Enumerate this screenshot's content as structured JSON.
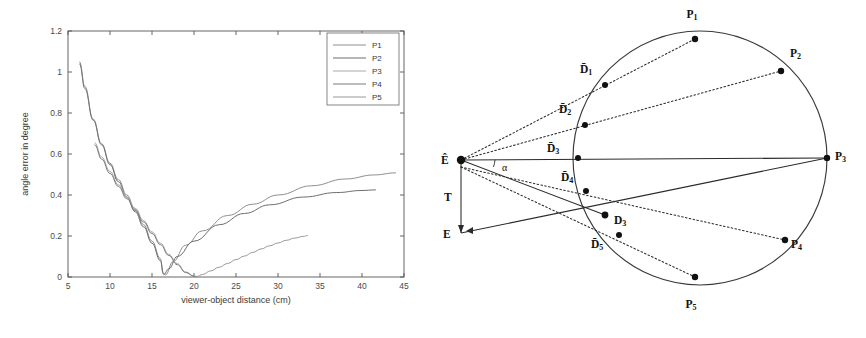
{
  "figure": {
    "panels": [
      "angle-error-plot",
      "viewing-geometry-diagram"
    ]
  },
  "chart_data": {
    "type": "line",
    "title": "",
    "xlabel": "viewer-object distance (cm)",
    "ylabel": "angle error in degree",
    "xlim": [
      5,
      45
    ],
    "ylim": [
      0,
      1.2
    ],
    "xticks": [
      "5",
      "10",
      "15",
      "20",
      "25",
      "30",
      "35",
      "40",
      "45"
    ],
    "yticks": [
      "0",
      "0.2",
      "0.4",
      "0.6",
      "0.8",
      "1",
      "1.2"
    ],
    "grid": false,
    "legend_position": "top-right",
    "series": [
      {
        "name": "P1",
        "color": "#8f8f8f",
        "points": [
          [
            6.4,
            1.05
          ],
          [
            7.0,
            0.93
          ],
          [
            8.0,
            0.77
          ],
          [
            9.0,
            0.65
          ],
          [
            10.0,
            0.555
          ],
          [
            11.0,
            0.475
          ],
          [
            12.0,
            0.4
          ],
          [
            13.0,
            0.33
          ],
          [
            14.0,
            0.255
          ],
          [
            15.0,
            0.175
          ],
          [
            16.0,
            0.09
          ],
          [
            16.3,
            0.02
          ],
          [
            16.6,
            0.01
          ],
          [
            17.5,
            0.075
          ],
          [
            19.0,
            0.155
          ],
          [
            21.0,
            0.225
          ],
          [
            24.0,
            0.3
          ],
          [
            27.0,
            0.355
          ],
          [
            30.0,
            0.4
          ],
          [
            34.0,
            0.445
          ],
          [
            38.0,
            0.478
          ],
          [
            41.5,
            0.498
          ],
          [
            44.0,
            0.508
          ]
        ]
      },
      {
        "name": "P2",
        "color": "#6e6e6e",
        "points": [
          [
            6.4,
            1.04
          ],
          [
            7.0,
            0.92
          ],
          [
            8.0,
            0.765
          ],
          [
            9.0,
            0.645
          ],
          [
            10.0,
            0.548
          ],
          [
            11.0,
            0.465
          ],
          [
            12.0,
            0.39
          ],
          [
            13.0,
            0.318
          ],
          [
            14.0,
            0.245
          ],
          [
            15.0,
            0.165
          ],
          [
            16.0,
            0.08
          ],
          [
            16.4,
            0.012
          ],
          [
            17.0,
            0.04
          ],
          [
            18.0,
            0.1
          ],
          [
            20.0,
            0.175
          ],
          [
            23.0,
            0.255
          ],
          [
            26.0,
            0.31
          ],
          [
            29.0,
            0.352
          ],
          [
            33.0,
            0.39
          ],
          [
            37.0,
            0.412
          ],
          [
            40.0,
            0.422
          ],
          [
            41.6,
            0.425
          ]
        ]
      },
      {
        "name": "P3",
        "color": "#a8a8a8",
        "points": [
          [
            8.2,
            0.655
          ],
          [
            9.0,
            0.585
          ],
          [
            10.0,
            0.515
          ],
          [
            11.0,
            0.45
          ],
          [
            12.0,
            0.39
          ],
          [
            13.0,
            0.335
          ],
          [
            14.0,
            0.275
          ],
          [
            15.0,
            0.22
          ],
          [
            16.0,
            0.165
          ],
          [
            17.0,
            0.11
          ],
          [
            18.0,
            0.065
          ],
          [
            19.0,
            0.025
          ],
          [
            20.0,
            0.005
          ],
          [
            20.4,
            0.002
          ]
        ]
      },
      {
        "name": "P4",
        "color": "#7a7a7a",
        "points": [
          [
            8.2,
            0.645
          ],
          [
            9.0,
            0.575
          ],
          [
            10.0,
            0.505
          ],
          [
            11.0,
            0.442
          ],
          [
            12.0,
            0.382
          ],
          [
            13.0,
            0.325
          ],
          [
            14.0,
            0.268
          ],
          [
            15.0,
            0.212
          ],
          [
            16.0,
            0.158
          ],
          [
            17.0,
            0.105
          ],
          [
            18.0,
            0.06
          ],
          [
            19.0,
            0.022
          ],
          [
            20.0,
            0.004
          ],
          [
            20.3,
            0.001
          ]
        ]
      },
      {
        "name": "P5",
        "color": "#999999",
        "points": [
          [
            20.4,
            0.003
          ],
          [
            21.0,
            0.012
          ],
          [
            22.0,
            0.03
          ],
          [
            23.0,
            0.048
          ],
          [
            24.0,
            0.066
          ],
          [
            25.0,
            0.085
          ],
          [
            26.0,
            0.102
          ],
          [
            27.0,
            0.12
          ],
          [
            28.0,
            0.137
          ],
          [
            29.0,
            0.152
          ],
          [
            30.0,
            0.166
          ],
          [
            31.0,
            0.179
          ],
          [
            32.0,
            0.19
          ],
          [
            33.0,
            0.198
          ],
          [
            33.5,
            0.202
          ]
        ]
      }
    ]
  },
  "legend": {
    "entries": [
      {
        "label": "P1"
      },
      {
        "label": "P2"
      },
      {
        "label": "P3"
      },
      {
        "label": "P4"
      },
      {
        "label": "P5"
      }
    ]
  },
  "diagram": {
    "name": "viewing-geometry-diagram",
    "labels": {
      "eye_estimated": "Ê",
      "eye_true": "E",
      "translation": "T",
      "angle": "α"
    },
    "circle_points": [
      {
        "id": "P1",
        "letter": "P",
        "sub": "1"
      },
      {
        "id": "P2",
        "letter": "P",
        "sub": "2"
      },
      {
        "id": "P3",
        "letter": "P",
        "sub": "3"
      },
      {
        "id": "P4",
        "letter": "P",
        "sub": "4"
      },
      {
        "id": "P5",
        "letter": "P",
        "sub": "5"
      }
    ],
    "direction_points": [
      {
        "id": "D1",
        "letter": "D̄",
        "sub": "1"
      },
      {
        "id": "D2",
        "letter": "D̄",
        "sub": "2"
      },
      {
        "id": "D3bar",
        "letter": "D̄",
        "sub": "3"
      },
      {
        "id": "D4",
        "letter": "D̄",
        "sub": "4"
      },
      {
        "id": "D3",
        "letter": "D",
        "sub": "3"
      },
      {
        "id": "D5",
        "letter": "D̄",
        "sub": "5"
      }
    ]
  }
}
